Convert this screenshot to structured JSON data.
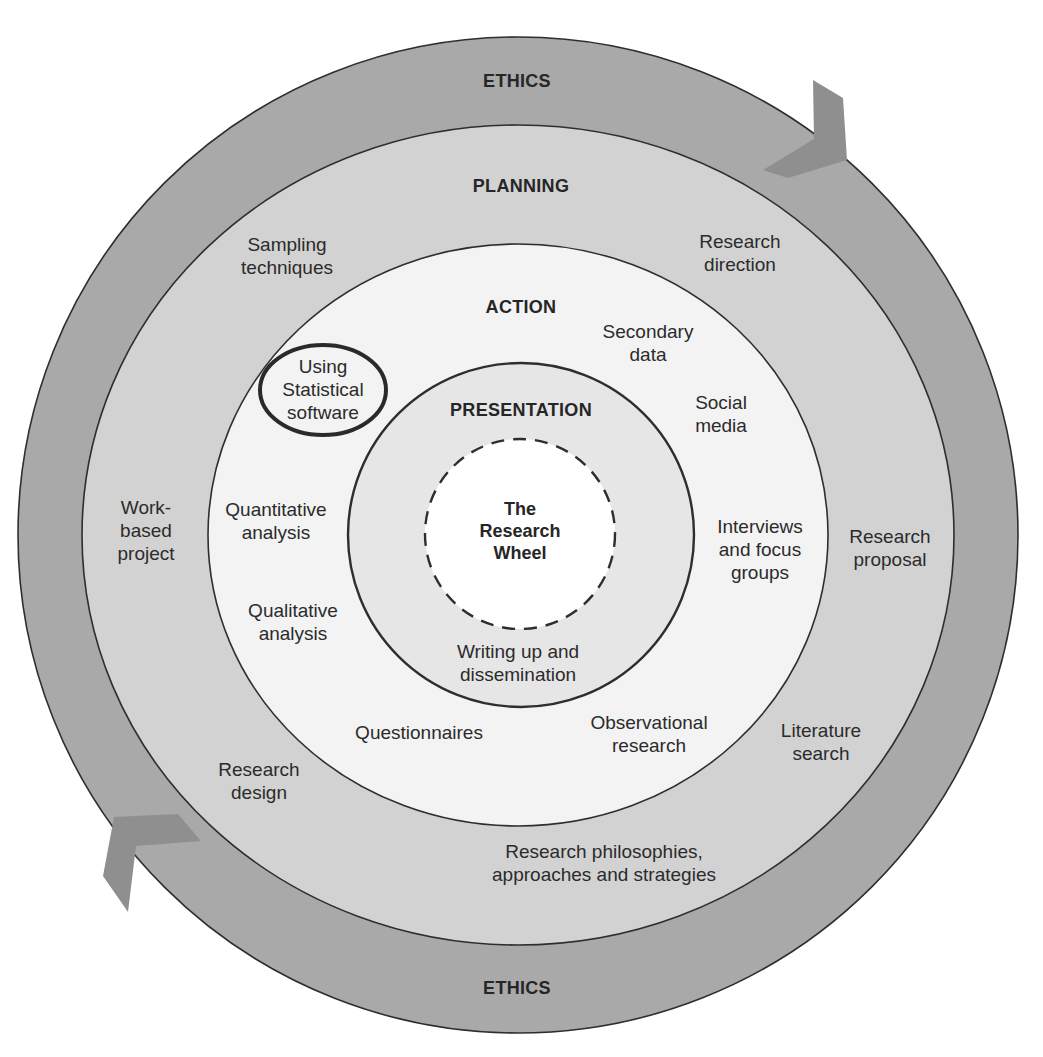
{
  "diagram": {
    "title": "The Research Wheel",
    "colors": {
      "ethics_ring": "#a9a9a9",
      "planning_ring": "#d2d2d2",
      "action_ring": "#f3f3f3",
      "presentation_ring": "#e6e6e6",
      "center": "#ffffff",
      "outline": "#2e2e2e",
      "arrow": "#8f8f8f"
    },
    "rings": {
      "ethics": {
        "title_top": "ETHICS",
        "title_bottom": "ETHICS"
      },
      "planning": {
        "title": "PLANNING",
        "items": [
          {
            "label": "Sampling\ntechniques"
          },
          {
            "label": "Research\ndirection"
          },
          {
            "label": "Work-\nbased\nproject"
          },
          {
            "label": "Research\nproposal"
          },
          {
            "label": "Research\ndesign"
          },
          {
            "label": "Literature\nsearch"
          },
          {
            "label": "Research philosophies,\napproaches and strategies"
          }
        ]
      },
      "action": {
        "title": "ACTION",
        "items": [
          {
            "label": "Using\nStatistical\nsoftware",
            "highlighted": true
          },
          {
            "label": "Secondary\ndata"
          },
          {
            "label": "Social\nmedia"
          },
          {
            "label": "Quantitative\nanalysis"
          },
          {
            "label": "Interviews\nand focus\ngroups"
          },
          {
            "label": "Qualitative\nanalysis"
          },
          {
            "label": "Questionnaires"
          },
          {
            "label": "Observational\nresearch"
          }
        ]
      },
      "presentation": {
        "title": "PRESENTATION",
        "items": [
          {
            "label": "Writing up and\ndissemination"
          }
        ]
      },
      "center": {
        "label": "The\nResearch\nWheel"
      }
    },
    "arrows": [
      {
        "name": "clockwise-arrow-top-right",
        "direction": "down"
      },
      {
        "name": "clockwise-arrow-bottom-left",
        "direction": "up"
      }
    ]
  }
}
